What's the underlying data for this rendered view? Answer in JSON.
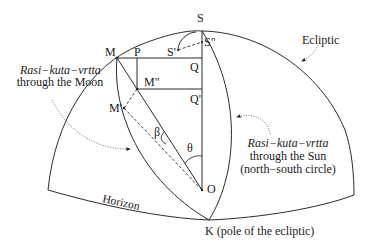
{
  "diagram": {
    "points": {
      "S": "S",
      "S_prime": "S'",
      "S_double_prime": "S\"",
      "M": "M",
      "M_prime": "M'",
      "M_double_prime": "M\"",
      "P": "P",
      "Q": "Q",
      "Q_prime": "Q'",
      "O": "O",
      "K": "K (pole of the ecliptic)"
    },
    "angles": {
      "beta": "β",
      "theta": "θ"
    },
    "labels": {
      "ecliptic": "Ecliptic",
      "horizon": "Horizon",
      "moon_circle_title": "Rasi−kuta−vrtta",
      "moon_circle_sub": "through the Moon",
      "sun_circle_title": "Rasi−kuta−vrtta",
      "sun_circle_sub1": "through the Sun",
      "sun_circle_sub2": "(north−south circle)"
    },
    "colors": {
      "line": "#2b2b2b",
      "background": "#ffffff"
    }
  }
}
